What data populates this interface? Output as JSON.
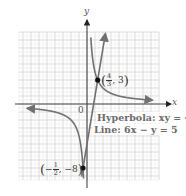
{
  "figure": {
    "x_axis_label": "x",
    "y_axis_label": "y",
    "origin_label": "0",
    "hyperbola_label": "Hyperbola: xy = 4",
    "line_label": "Line: 6x − y = 5",
    "points": [
      {
        "num": "4",
        "den": "3",
        "sign": "",
        "y": "3"
      },
      {
        "num": "1",
        "den": "2",
        "sign": "−",
        "y": "−8"
      }
    ],
    "colors": {
      "curve": "#707070",
      "axis": "#444444",
      "grid": "#c8c8c8",
      "point": "#111111",
      "label": "#6a6a6a"
    }
  },
  "chart_data": {
    "type": "line",
    "title": "",
    "xlabel": "x",
    "ylabel": "y",
    "xlim": [
      -8.5,
      9
    ],
    "ylim": [
      -9.5,
      9
    ],
    "grid": true,
    "series": [
      {
        "name": "Hyperbola: xy = 4",
        "equation": "y = 4/x",
        "branches": [
          "x > 0",
          "x < 0"
        ]
      },
      {
        "name": "Line: 6x - y = 5",
        "equation": "y = 6x - 5"
      }
    ],
    "annotations": [
      {
        "label": "(4/3, 3)",
        "x": 1.3333,
        "y": 3
      },
      {
        "label": "(-1/2, -8)",
        "x": -0.5,
        "y": -8
      },
      {
        "label": "0",
        "x": 0,
        "y": 0
      }
    ]
  }
}
